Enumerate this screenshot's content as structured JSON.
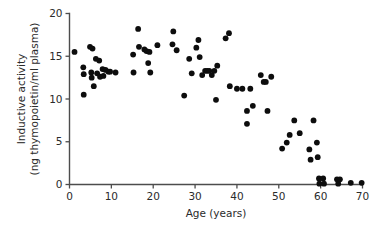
{
  "chart_data": {
    "type": "scatter",
    "title": "",
    "xlabel": "Age (years)",
    "ylabel": "Inductive activity (ng thymopoietin/ml plasma)",
    "ylabel_line1": "Inductive activity",
    "ylabel_line2": "(ng thymopoietin/ml plasma)",
    "xlim": [
      0,
      70
    ],
    "ylim": [
      0,
      20
    ],
    "xticks": [
      0,
      10,
      20,
      30,
      40,
      50,
      60,
      70
    ],
    "yticks": [
      0,
      5,
      10,
      15,
      20
    ],
    "xtick_labels": [
      "0",
      "10",
      "20",
      "30",
      "40",
      "50",
      "60",
      "70"
    ],
    "ytick_labels": [
      "0",
      "5",
      "10",
      "15",
      "20"
    ],
    "grid": false,
    "legend": null,
    "marker": "filled-circle",
    "marker_color": "#0d0d0d",
    "marker_size_px": 4.0,
    "series": [
      {
        "name": "Inductive activity vs age",
        "points": [
          [
            1.2,
            15.5
          ],
          [
            3.3,
            13.7
          ],
          [
            3.4,
            12.9
          ],
          [
            3.4,
            10.5
          ],
          [
            4.9,
            16.1
          ],
          [
            5.5,
            15.9
          ],
          [
            5.2,
            13.1
          ],
          [
            5.3,
            12.5
          ],
          [
            5.8,
            11.5
          ],
          [
            6.3,
            14.7
          ],
          [
            6.6,
            13.0
          ],
          [
            7.1,
            14.5
          ],
          [
            7.3,
            12.6
          ],
          [
            7.9,
            13.5
          ],
          [
            8.1,
            12.7
          ],
          [
            8.6,
            13.4
          ],
          [
            9.3,
            13.2
          ],
          [
            9.7,
            13.2
          ],
          [
            11.0,
            13.1
          ],
          [
            15.2,
            15.2
          ],
          [
            15.3,
            13.1
          ],
          [
            16.4,
            18.2
          ],
          [
            16.6,
            16.1
          ],
          [
            17.9,
            15.8
          ],
          [
            18.4,
            15.6
          ],
          [
            18.8,
            14.2
          ],
          [
            19.1,
            15.5
          ],
          [
            19.3,
            13.1
          ],
          [
            21.0,
            16.3
          ],
          [
            24.6,
            16.4
          ],
          [
            24.8,
            17.9
          ],
          [
            25.6,
            15.7
          ],
          [
            27.4,
            10.4
          ],
          [
            28.6,
            14.7
          ],
          [
            29.2,
            13.0
          ],
          [
            30.3,
            16.0
          ],
          [
            30.8,
            16.9
          ],
          [
            31.1,
            14.9
          ],
          [
            31.7,
            12.8
          ],
          [
            32.4,
            13.3
          ],
          [
            32.9,
            13.3
          ],
          [
            33.4,
            13.3
          ],
          [
            34.0,
            12.8
          ],
          [
            34.6,
            13.3
          ],
          [
            35.0,
            9.9
          ],
          [
            35.3,
            13.9
          ],
          [
            37.3,
            17.1
          ],
          [
            38.1,
            17.7
          ],
          [
            38.3,
            11.5
          ],
          [
            40.0,
            11.2
          ],
          [
            41.3,
            11.2
          ],
          [
            42.4,
            8.6
          ],
          [
            42.4,
            7.1
          ],
          [
            43.2,
            11.2
          ],
          [
            43.8,
            9.2
          ],
          [
            45.7,
            12.8
          ],
          [
            46.4,
            12.0
          ],
          [
            46.9,
            12.0
          ],
          [
            47.3,
            8.6
          ],
          [
            48.2,
            12.6
          ],
          [
            50.8,
            4.2
          ],
          [
            51.9,
            4.9
          ],
          [
            52.6,
            5.8
          ],
          [
            53.7,
            7.5
          ],
          [
            55.0,
            6.0
          ],
          [
            57.3,
            4.1
          ],
          [
            57.6,
            2.9
          ],
          [
            58.3,
            7.5
          ],
          [
            59.1,
            4.9
          ],
          [
            59.3,
            3.2
          ],
          [
            59.6,
            0.7
          ],
          [
            59.7,
            0.1
          ],
          [
            60.6,
            0.7
          ],
          [
            60.8,
            0.1
          ],
          [
            63.9,
            0.6
          ],
          [
            64.2,
            0.1
          ],
          [
            64.6,
            0.6
          ],
          [
            67.2,
            0.2
          ],
          [
            69.8,
            0.2
          ]
        ]
      }
    ]
  },
  "axes": {
    "x_title": "Age (years)",
    "y_title_line1": "Inductive activity",
    "y_title_line2": "(ng thymopoietin/ml plasma)"
  }
}
